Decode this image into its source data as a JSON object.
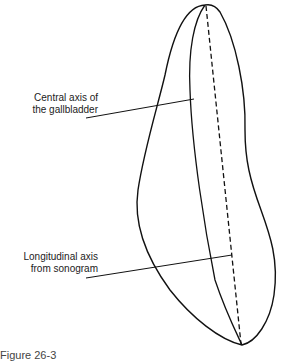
{
  "figure": {
    "caption": "Figure 26-3",
    "labels": {
      "central_axis_line1": "Central axis of",
      "central_axis_line2": "the gallbladder",
      "longitudinal_line1": "Longitudinal axis",
      "longitudinal_line2": "from sonogram"
    },
    "colors": {
      "outline": "#111111",
      "background": "#ffffff"
    }
  }
}
